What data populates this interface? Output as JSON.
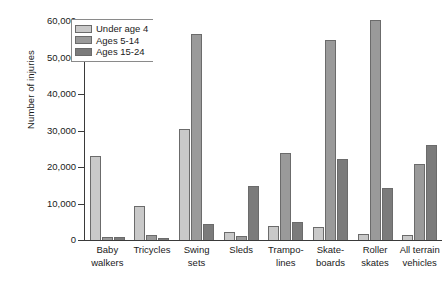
{
  "chart_data": {
    "type": "bar",
    "title": "",
    "xlabel": "",
    "ylabel": "Number of injuries",
    "ylim": [
      0,
      60000
    ],
    "yticks": [
      0,
      10000,
      20000,
      30000,
      40000,
      50000,
      60000
    ],
    "ytick_labels": [
      "0",
      "10,000",
      "20,000",
      "30,000",
      "40,000",
      "50,000",
      "60,000"
    ],
    "grid": false,
    "legend_position": "top-left",
    "categories": [
      "Baby walkers",
      "Tricycles",
      "Swing sets",
      "Sleds",
      "Trampolines",
      "Skateboards",
      "Roller skates",
      "All terrain vehicles"
    ],
    "category_lines": [
      [
        "Baby",
        "walkers"
      ],
      [
        "Tricycles"
      ],
      [
        "Swing",
        "sets"
      ],
      [
        "Sleds"
      ],
      [
        "Trampo-",
        "lines"
      ],
      [
        "Skate-",
        "boards"
      ],
      [
        "Roller",
        "skates"
      ],
      [
        "All terrain",
        "vehicles"
      ]
    ],
    "series": [
      {
        "name": "Under age 4",
        "color": "#c9c9c9",
        "values": [
          23000,
          9400,
          30500,
          2200,
          3800,
          3600,
          1700,
          1500
        ]
      },
      {
        "name": "Ages 5-14",
        "color": "#9a9a9a",
        "values": [
          800,
          1300,
          56400,
          1100,
          23800,
          54800,
          60300,
          20700
        ]
      },
      {
        "name": "Ages 15-24",
        "color": "#7b7b7b",
        "values": [
          700,
          400,
          4400,
          14800,
          5000,
          22300,
          14200,
          25900
        ]
      }
    ]
  },
  "legend": {
    "items": [
      {
        "label": "Under age 4"
      },
      {
        "label": "Ages 5-14"
      },
      {
        "label": "Ages 15-24"
      }
    ]
  }
}
